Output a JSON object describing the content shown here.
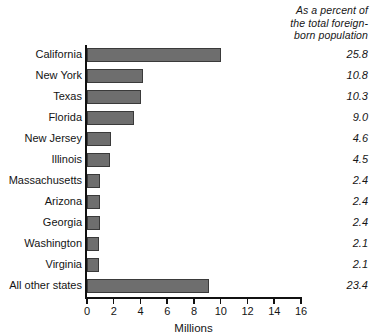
{
  "chart_data": {
    "type": "bar",
    "orientation": "horizontal",
    "title": "",
    "xlabel": "Millions",
    "ylabel": "",
    "xlim": [
      0,
      16
    ],
    "xticks": [
      0,
      2,
      4,
      6,
      8,
      10,
      12,
      14,
      16
    ],
    "xtick_labels": [
      "0",
      "2",
      "4",
      "6",
      "8",
      "10",
      "12",
      "14",
      "16"
    ],
    "grid": false,
    "legend": null,
    "bar_color": "#6e6e6e",
    "bar_edge_color": "#3a3a3a",
    "axis_color": "#111111",
    "categories": [
      "California",
      "New York",
      "Texas",
      "Florida",
      "New Jersey",
      "Illinois",
      "Massachusetts",
      "Arizona",
      "Georgia",
      "Washington",
      "Virginia",
      "All other states"
    ],
    "values": [
      10.0,
      4.2,
      4.0,
      3.5,
      1.8,
      1.7,
      1.0,
      1.0,
      1.0,
      0.9,
      0.9,
      9.1
    ],
    "value_column": {
      "header_lines": [
        "As a percent of",
        "the total foreign-",
        "born population"
      ],
      "values": [
        "25.8",
        "10.8",
        "10.3",
        "9.0",
        "4.6",
        "4.5",
        "2.4",
        "2.4",
        "2.4",
        "2.1",
        "2.1",
        "23.4"
      ]
    }
  }
}
